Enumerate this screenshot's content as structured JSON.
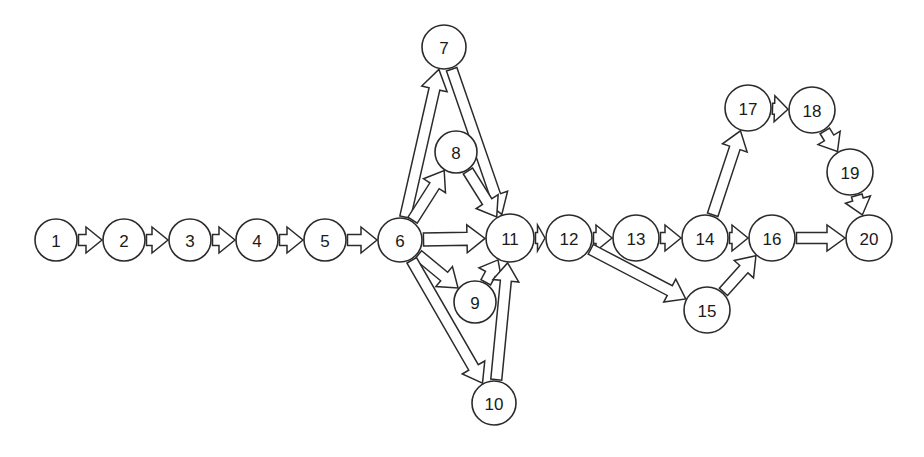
{
  "diagram": {
    "background_color": "#ffffff",
    "node_fill": "#ffffff",
    "node_stroke": "#2b2b2b",
    "arrow_fill": "#ffffff",
    "arrow_stroke": "#2b2b2b",
    "node_radius": 21,
    "arrow_style": "hollow-block-arrow"
  },
  "nodes": [
    {
      "id": 1,
      "label": "1",
      "x": 56,
      "y": 240,
      "r": 21
    },
    {
      "id": 2,
      "label": "2",
      "x": 124,
      "y": 240,
      "r": 21
    },
    {
      "id": 3,
      "label": "3",
      "x": 190,
      "y": 240,
      "r": 21
    },
    {
      "id": 4,
      "label": "4",
      "x": 257,
      "y": 240,
      "r": 21
    },
    {
      "id": 5,
      "label": "5",
      "x": 325,
      "y": 240,
      "r": 21
    },
    {
      "id": 6,
      "label": "6",
      "x": 400,
      "y": 240,
      "r": 22
    },
    {
      "id": 7,
      "label": "7",
      "x": 444,
      "y": 47,
      "r": 22
    },
    {
      "id": 8,
      "label": "8",
      "x": 456,
      "y": 152,
      "r": 21
    },
    {
      "id": 9,
      "label": "9",
      "x": 475,
      "y": 302,
      "r": 21
    },
    {
      "id": 10,
      "label": "10",
      "x": 494,
      "y": 403,
      "r": 22
    },
    {
      "id": 11,
      "label": "11",
      "x": 510,
      "y": 238,
      "r": 24
    },
    {
      "id": 12,
      "label": "12",
      "x": 569,
      "y": 238,
      "r": 23
    },
    {
      "id": 13,
      "label": "13",
      "x": 636,
      "y": 238,
      "r": 23
    },
    {
      "id": 14,
      "label": "14",
      "x": 705,
      "y": 238,
      "r": 23
    },
    {
      "id": 15,
      "label": "15",
      "x": 707,
      "y": 310,
      "r": 23
    },
    {
      "id": 16,
      "label": "16",
      "x": 772,
      "y": 238,
      "r": 23
    },
    {
      "id": 17,
      "label": "17",
      "x": 748,
      "y": 108,
      "r": 23
    },
    {
      "id": 18,
      "label": "18",
      "x": 812,
      "y": 110,
      "r": 23
    },
    {
      "id": 19,
      "label": "19",
      "x": 850,
      "y": 172,
      "r": 23
    },
    {
      "id": 20,
      "label": "20",
      "x": 869,
      "y": 238,
      "r": 23
    }
  ],
  "edges": [
    {
      "from": 1,
      "to": 2,
      "shaft": 5.5,
      "head_w": 13,
      "head_len": 16
    },
    {
      "from": 2,
      "to": 3,
      "shaft": 5.5,
      "head_w": 13,
      "head_len": 16
    },
    {
      "from": 3,
      "to": 4,
      "shaft": 5.5,
      "head_w": 13,
      "head_len": 16
    },
    {
      "from": 4,
      "to": 5,
      "shaft": 5.5,
      "head_w": 13,
      "head_len": 16
    },
    {
      "from": 5,
      "to": 6,
      "shaft": 5.5,
      "head_w": 13,
      "head_len": 16
    },
    {
      "from": 6,
      "to": 7,
      "shaft": 5.5,
      "head_w": 13,
      "head_len": 20
    },
    {
      "from": 6,
      "to": 8,
      "shaft": 5.5,
      "head_w": 13,
      "head_len": 18
    },
    {
      "from": 6,
      "to": 9,
      "shaft": 5.5,
      "head_w": 13,
      "head_len": 18
    },
    {
      "from": 6,
      "to": 10,
      "shaft": 5.5,
      "head_w": 13,
      "head_len": 18
    },
    {
      "from": 6,
      "to": 11,
      "shaft": 6.5,
      "head_w": 14,
      "head_len": 18
    },
    {
      "from": 7,
      "to": 11,
      "shaft": 5.5,
      "head_w": 13,
      "head_len": 20
    },
    {
      "from": 8,
      "to": 11,
      "shaft": 5.5,
      "head_w": 13,
      "head_len": 18
    },
    {
      "from": 9,
      "to": 11,
      "shaft": 5.5,
      "head_w": 13,
      "head_len": 16
    },
    {
      "from": 10,
      "to": 11,
      "shaft": 5.5,
      "head_w": 13,
      "head_len": 18
    },
    {
      "from": 11,
      "to": 12,
      "shaft": 5.5,
      "head_w": 13,
      "head_len": 14
    },
    {
      "from": 12,
      "to": 13,
      "shaft": 5.5,
      "head_w": 13,
      "head_len": 16
    },
    {
      "from": 12,
      "to": 15,
      "shaft": 5.5,
      "head_w": 13,
      "head_len": 18
    },
    {
      "from": 13,
      "to": 14,
      "shaft": 5.5,
      "head_w": 13,
      "head_len": 16
    },
    {
      "from": 14,
      "to": 16,
      "shaft": 5.5,
      "head_w": 13,
      "head_len": 16
    },
    {
      "from": 14,
      "to": 17,
      "shaft": 5.5,
      "head_w": 13,
      "head_len": 18
    },
    {
      "from": 15,
      "to": 16,
      "shaft": 5.5,
      "head_w": 13,
      "head_len": 18
    },
    {
      "from": 16,
      "to": 20,
      "shaft": 5.5,
      "head_w": 13,
      "head_len": 18
    },
    {
      "from": 17,
      "to": 18,
      "shaft": 5.5,
      "head_w": 13,
      "head_len": 14
    },
    {
      "from": 18,
      "to": 19,
      "shaft": 5.5,
      "head_w": 13,
      "head_len": 16
    },
    {
      "from": 19,
      "to": 20,
      "shaft": 5.5,
      "head_w": 13,
      "head_len": 16
    }
  ]
}
